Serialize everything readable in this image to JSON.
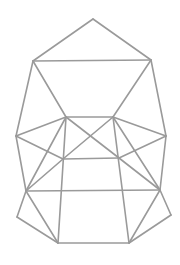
{
  "diagram": {
    "type": "wireframe-polyhedron-net",
    "line_color": "#9a9a9a",
    "background": "#ffffff",
    "vertices": {
      "apex": [
        93,
        19
      ],
      "upper_left": [
        33,
        61
      ],
      "upper_right": [
        151,
        60
      ],
      "quad_top_left": [
        66,
        117
      ],
      "quad_top_right": [
        113,
        117
      ],
      "left_outer": [
        16,
        136
      ],
      "right_outer": [
        166,
        136
      ],
      "quad_bottom_left": [
        63,
        159
      ],
      "quad_bottom_right": [
        119,
        158
      ],
      "lower_left": [
        26,
        191
      ],
      "lower_right": [
        160,
        190
      ],
      "far_left": [
        17,
        217
      ],
      "far_right": [
        171,
        215
      ],
      "bottom_left": [
        58,
        243
      ],
      "bottom_right": [
        129,
        243
      ]
    },
    "edges": [
      [
        "apex",
        "upper_left"
      ],
      [
        "apex",
        "upper_right"
      ],
      [
        "upper_left",
        "upper_right"
      ],
      [
        "upper_left",
        "quad_top_left"
      ],
      [
        "upper_right",
        "quad_top_right"
      ],
      [
        "upper_left",
        "left_outer"
      ],
      [
        "upper_right",
        "right_outer"
      ],
      [
        "quad_top_left",
        "quad_top_right"
      ],
      [
        "quad_top_left",
        "left_outer"
      ],
      [
        "quad_top_right",
        "right_outer"
      ],
      [
        "quad_top_left",
        "quad_bottom_right"
      ],
      [
        "quad_top_right",
        "quad_bottom_left"
      ],
      [
        "left_outer",
        "quad_bottom_left"
      ],
      [
        "right_outer",
        "quad_bottom_right"
      ],
      [
        "quad_bottom_left",
        "quad_bottom_right"
      ],
      [
        "quad_top_left",
        "lower_left"
      ],
      [
        "quad_top_right",
        "lower_right"
      ],
      [
        "quad_top_left",
        "bottom_left"
      ],
      [
        "quad_top_right",
        "bottom_right"
      ],
      [
        "left_outer",
        "lower_left"
      ],
      [
        "right_outer",
        "lower_right"
      ],
      [
        "quad_bottom_left",
        "lower_left"
      ],
      [
        "quad_bottom_right",
        "lower_right"
      ],
      [
        "lower_left",
        "lower_right"
      ],
      [
        "lower_left",
        "far_left"
      ],
      [
        "far_left",
        "bottom_left"
      ],
      [
        "lower_left",
        "bottom_left"
      ],
      [
        "lower_right",
        "far_right"
      ],
      [
        "far_right",
        "bottom_right"
      ],
      [
        "lower_right",
        "bottom_right"
      ],
      [
        "bottom_left",
        "bottom_right"
      ]
    ]
  }
}
